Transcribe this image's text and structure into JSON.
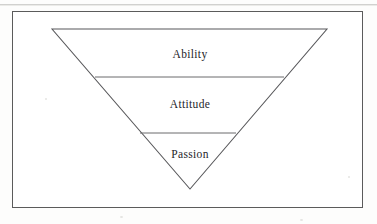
{
  "figure": {
    "type": "inverted-triangle-hierarchy",
    "background_color": "#fdfdfc",
    "panel_color": "#ffffff",
    "border_color": "#5b5b5b",
    "stroke_color": "#57575a",
    "text_color": "#25252a",
    "frame": {
      "x": 12,
      "y": 11,
      "width": 351,
      "height": 197
    },
    "triangle": {
      "top_left": {
        "x": 52,
        "y": 29
      },
      "top_right": {
        "x": 327,
        "y": 29
      },
      "apex": {
        "x": 190,
        "y": 189
      }
    },
    "dividers": [
      {
        "name": "ability-attitude-divider",
        "y": 77,
        "x1": 95,
        "x2": 284
      },
      {
        "name": "attitude-passion-divider",
        "y": 133,
        "x1": 140,
        "x2": 236
      }
    ],
    "tiers": [
      {
        "label": "Ability",
        "center_x": 190,
        "center_y": 54
      },
      {
        "label": "Attitude",
        "center_x": 190,
        "center_y": 104
      },
      {
        "label": "Passion",
        "center_x": 190,
        "center_y": 154
      }
    ]
  }
}
